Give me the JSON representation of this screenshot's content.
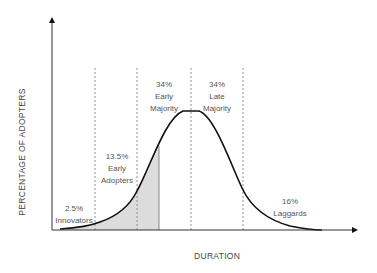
{
  "diagram": {
    "y_axis_label": "PERCENTAGE OF ADOPTERS",
    "x_axis_label": "DURATION",
    "colors": {
      "curve": "#111111",
      "axis": "#333333",
      "dashed_lines": "#666666",
      "shaded_area": "#dcdcdc",
      "text": "#555555"
    },
    "segments": [
      {
        "percent": "2.5%",
        "name": "Innovators"
      },
      {
        "percent": "13.5%",
        "name_line1": "Early",
        "name_line2": "Adopters"
      },
      {
        "percent": "34%",
        "name_line1": "Early",
        "name_line2": "Majority"
      },
      {
        "percent": "34%",
        "name_line1": "Late",
        "name_line2": "Majority"
      },
      {
        "percent": "16%",
        "name": "Laggards"
      }
    ]
  }
}
